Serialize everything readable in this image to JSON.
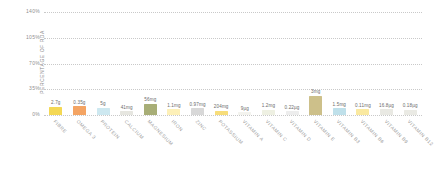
{
  "chart_data": {
    "type": "bar",
    "title": "",
    "subtitle": "",
    "xlabel": "",
    "ylabel": "PERCENTAGE OF RDA",
    "ylim": [
      0,
      140
    ],
    "yticks": [
      "0%",
      "35%",
      "70%",
      "105%",
      "140%"
    ],
    "ytick_values": [
      0,
      35,
      70,
      105,
      140
    ],
    "grid": true,
    "legend": "none",
    "categories": [
      "FIBRE",
      "OMEGA 3",
      "PROTEIN",
      "CALCIUM",
      "MAGNESIUM",
      "IRON",
      "ZINC",
      "POTASSIUM",
      "VITAMIN A",
      "VITAMIN C",
      "VITAMIN D",
      "VITAMIN E",
      "VITAMIN B3",
      "VITAMIN B6",
      "VITAMIN B9",
      "VITAMIN B12"
    ],
    "values": [
      11,
      12,
      10,
      5,
      15,
      8,
      9,
      6,
      4,
      7,
      5,
      26,
      9,
      8,
      8,
      7
    ],
    "data_labels": [
      "2.7g",
      "0.35g",
      "5g",
      "41mg",
      "56mg",
      "1.1mg",
      "0.97mg",
      "204mg",
      "9µg",
      "1.2mg",
      "0.22µg",
      "3mg",
      "1.5mg",
      "0.11mg",
      "16.8µg",
      "0.18µg"
    ],
    "bar_colors": [
      "#f2d857",
      "#f4a26b",
      "#cfe6ef",
      "#e3e3dd",
      "#a9b униф"
    ]
  },
  "colors": {
    "grid": "#c9c9c9",
    "axis_text": "#8f8f8f",
    "value_text": "#6b6b6b",
    "category_text": "#9a9a9a",
    "background": "#ffffff",
    "bars": [
      "#f4d854",
      "#f4a463",
      "#cde8f0",
      "#e6e6e0",
      "#a8ae77",
      "#fdf0b8",
      "#d8d8d8",
      "#f7dd7a",
      "#f3f3ee",
      "#eef0e2",
      "#ededed",
      "#cdc08a",
      "#bfe0ea",
      "#fae9a0",
      "#e9e9e3",
      "#eaeae4"
    ]
  }
}
